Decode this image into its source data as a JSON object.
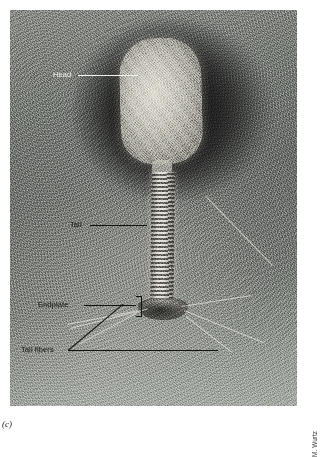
{
  "figure": {
    "letter": "(c)",
    "credit": "M. Wurtz"
  },
  "micrograph": {
    "technique": "negative-stain-transmission-electron-micrograph",
    "background_color": "#7e827d",
    "specimen_color": "#d6d3ca"
  },
  "annotations": [
    {
      "id": "head",
      "label": "Head",
      "tone": "light"
    },
    {
      "id": "tail",
      "label": "Tail",
      "tone": "dark"
    },
    {
      "id": "endplate",
      "label": "Endplate",
      "tone": "dark"
    },
    {
      "id": "tail_fibers",
      "label": "Tail fibers",
      "tone": "dark"
    }
  ],
  "structures": {
    "head": "prolate-icosahedral-capsid",
    "neck": "collar",
    "tail": "contractile-striated-tail-sheath",
    "endplate": "baseplate",
    "fibers": "long-tail-fibers"
  }
}
